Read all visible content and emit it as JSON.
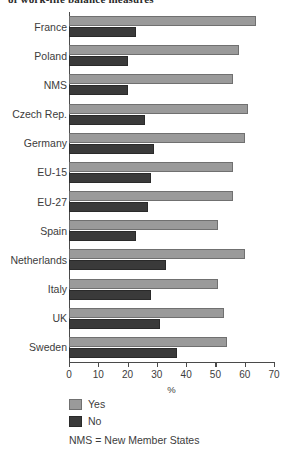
{
  "chart_data": {
    "type": "bar",
    "orientation": "horizontal",
    "title": "of work-life balance measures",
    "categories": [
      "France",
      "Poland",
      "NMS",
      "Czech Rep.",
      "Germany",
      "EU-15",
      "EU-27",
      "Spain",
      "Netherlands",
      "Italy",
      "UK",
      "Sweden"
    ],
    "series": [
      {
        "name": "Yes",
        "color": "#9a9a9a",
        "values": [
          64,
          58,
          56,
          61,
          60,
          56,
          56,
          51,
          60,
          51,
          53,
          54
        ]
      },
      {
        "name": "No",
        "color": "#3a3a3a",
        "values": [
          23,
          20,
          20,
          26,
          29,
          28,
          27,
          23,
          33,
          28,
          31,
          37
        ]
      }
    ],
    "xlabel": "%",
    "ylabel": "",
    "xlim": [
      0,
      70
    ],
    "xticks": [
      0,
      10,
      20,
      30,
      40,
      50,
      60,
      70
    ],
    "xtick_labels": [
      "0",
      "10",
      "20",
      "30",
      "40",
      "50",
      "60",
      "70"
    ],
    "grid": false,
    "legend_position": "bottom-left",
    "legend_entries": [
      "Yes",
      "No"
    ],
    "footnote": "NMS = New Member States"
  }
}
